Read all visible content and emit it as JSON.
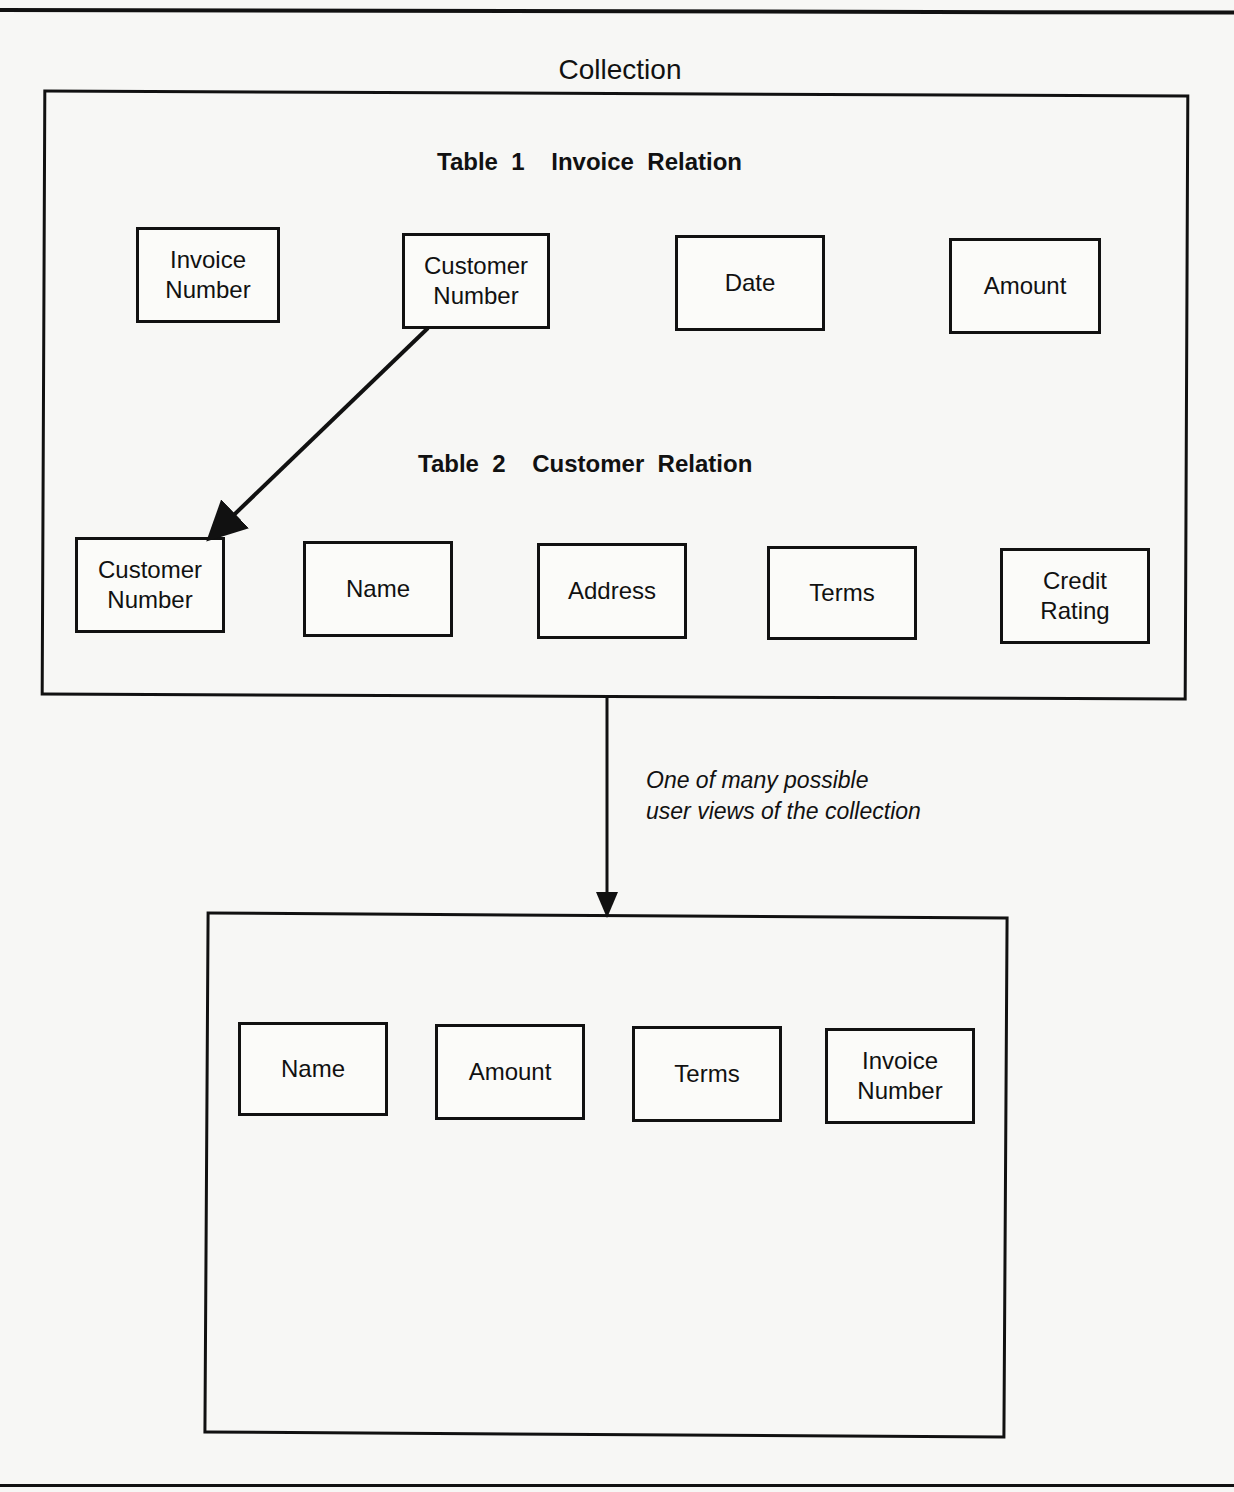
{
  "figure": {
    "title": "Collection",
    "collection": {
      "table1": {
        "title": "Table  1    Invoice  Relation",
        "fields": [
          "Invoice\nNumber",
          "Customer\nNumber",
          "Date",
          "Amount"
        ]
      },
      "table2": {
        "title": "Table  2    Customer  Relation",
        "fields": [
          "Customer\nNumber",
          "Name",
          "Address",
          "Terms",
          "Credit\nRating"
        ]
      },
      "link": {
        "from": "Table 1: Customer Number",
        "to": "Table 2: Customer Number"
      }
    },
    "view_arrow_label_line1": "One of many possible",
    "view_arrow_label_line2": "user views of the collection",
    "user_view": {
      "fields": [
        "Name",
        "Amount",
        "Terms",
        "Invoice\nNumber"
      ]
    }
  }
}
